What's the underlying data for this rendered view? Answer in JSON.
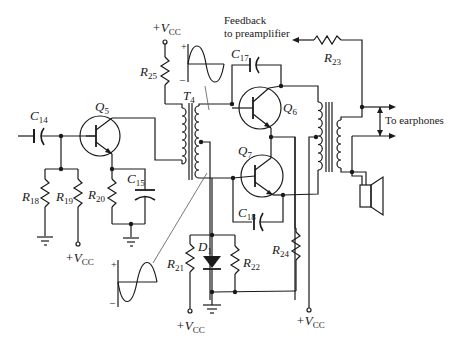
{
  "diagram": {
    "type": "circuit-schematic"
  },
  "labels": {
    "feedback_line1": "Feedback",
    "feedback_line2": "to preamplifier",
    "to_earphones": "To earphones",
    "vcc_plus": "+V",
    "vcc_sub": "CC"
  },
  "components": {
    "capacitors": [
      {
        "id": "C14",
        "letter": "C",
        "sub": "14"
      },
      {
        "id": "C15",
        "letter": "C",
        "sub": "15"
      },
      {
        "id": "C17",
        "letter": "C",
        "sub": "17"
      },
      {
        "id": "C18",
        "letter": "C",
        "sub": "18"
      }
    ],
    "transistors": [
      {
        "id": "Q5",
        "letter": "Q",
        "sub": "5"
      },
      {
        "id": "Q6",
        "letter": "Q",
        "sub": "6"
      },
      {
        "id": "Q7",
        "letter": "Q",
        "sub": "7"
      }
    ],
    "resistors": [
      {
        "id": "R18",
        "letter": "R",
        "sub": "18"
      },
      {
        "id": "R19",
        "letter": "R",
        "sub": "19"
      },
      {
        "id": "R20",
        "letter": "R",
        "sub": "20"
      },
      {
        "id": "R21",
        "letter": "R",
        "sub": "21"
      },
      {
        "id": "R22",
        "letter": "R",
        "sub": "22"
      },
      {
        "id": "R23",
        "letter": "R",
        "sub": "23"
      },
      {
        "id": "R24",
        "letter": "R",
        "sub": "24"
      },
      {
        "id": "R25",
        "letter": "R",
        "sub": "25"
      }
    ],
    "transformers": [
      {
        "id": "T4",
        "letter": "T",
        "sub": "4"
      }
    ],
    "diodes": [
      {
        "id": "D1",
        "letter": "D",
        "sub": "1"
      }
    ]
  },
  "waveforms": {
    "plus": "+",
    "minus": "–"
  }
}
